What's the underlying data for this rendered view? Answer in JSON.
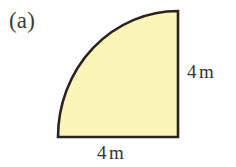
{
  "figure": {
    "part_label": "(a)",
    "shape_name": "quarter-circle",
    "fill_color": "#faf6b8",
    "stroke_color": "#2a2420",
    "background_color": "#ffffff",
    "dimensions": [
      {
        "id": "right-side",
        "value": "4",
        "unit": "m",
        "text": "4 m",
        "position": "right"
      },
      {
        "id": "bottom-side",
        "value": "4",
        "unit": "m",
        "text": "4 m",
        "position": "bottom"
      }
    ]
  },
  "chart_data": {
    "type": "diagram",
    "title": "(a)",
    "shape": "quarter circle sector",
    "radius": 4,
    "radius_unit": "m",
    "labels": [
      "4 m",
      "4 m"
    ],
    "geometry": {
      "center_x": 178,
      "center_y": 137,
      "corner_bottom_left": [
        58,
        137
      ],
      "corner_bottom_right": [
        178,
        137
      ],
      "corner_top_right": [
        178,
        11
      ],
      "arc_from": [
        58,
        137
      ],
      "arc_to": [
        178,
        11
      ],
      "sweep_degrees": 90
    },
    "fill": "#faf6b8",
    "stroke": "#2a2420",
    "stroke_width": 2.6
  }
}
